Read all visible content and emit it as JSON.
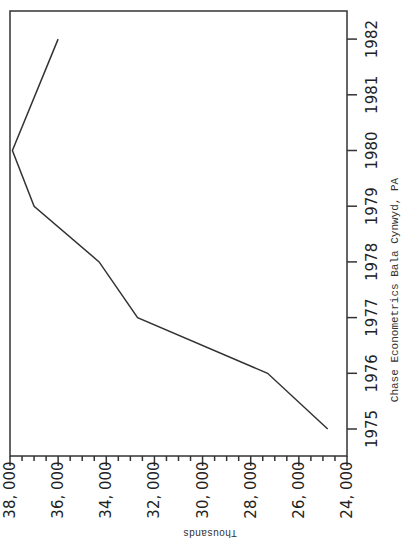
{
  "chart_data": {
    "type": "line",
    "orientation": "rotated-90 (years on right vertical axis, values on bottom horizontal axis, reversed)",
    "title": "",
    "xlabel": "",
    "ylabel": "Thousands",
    "source_note": "Chase Econometrics Bala Cynwyd, PA",
    "categories": [
      "1975",
      "1976",
      "1977",
      "1978",
      "1979",
      "1980",
      "1981",
      "1982"
    ],
    "series": [
      {
        "name": "Value",
        "x": [
          "1975",
          "1976",
          "1977",
          "1978",
          "1979",
          "1980",
          "1982"
        ],
        "values": [
          24800,
          27300,
          32700,
          34300,
          37000,
          37900,
          36000
        ]
      }
    ],
    "value_ticks": [
      "38, 000",
      "36, 000",
      "34, 000",
      "32, 000",
      "30, 000",
      "28, 000",
      "26, 000",
      "24, 000"
    ],
    "ylim": [
      24000,
      38000
    ],
    "grid": false,
    "legend": "none"
  }
}
